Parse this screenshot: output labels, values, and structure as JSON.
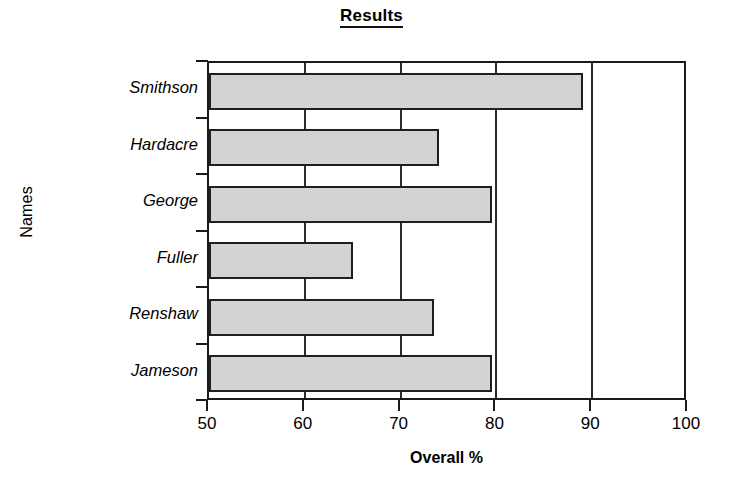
{
  "chart_data": {
    "type": "bar",
    "orientation": "horizontal",
    "title": "Results",
    "xlabel": "Overall %",
    "ylabel": "Names",
    "categories": [
      "Smithson",
      "Hardacre",
      "George",
      "Fuller",
      "Renshaw",
      "Jameson"
    ],
    "values": [
      89,
      74,
      79.5,
      65,
      73.5,
      79.5
    ],
    "xlim": [
      50,
      100
    ],
    "xticks": [
      50,
      60,
      70,
      80,
      90,
      100
    ],
    "xtick_labels": [
      "50",
      "60",
      "70",
      "80",
      "90",
      "100"
    ],
    "grid": "vertical",
    "legend": "none",
    "bar_fill": "#d3d3d3",
    "bar_edge": "#1f1f1f",
    "axis_color": "#1a1a1a"
  }
}
